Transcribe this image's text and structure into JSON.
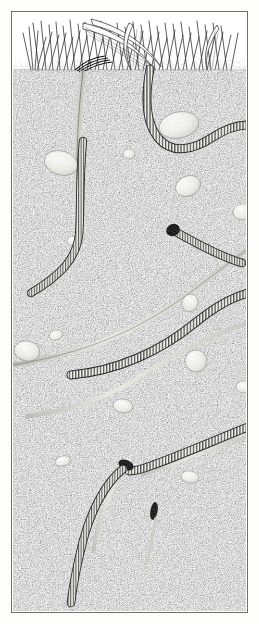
{
  "figure": {
    "medium": "pen-and-ink stipple illustration",
    "orientation": "vertical",
    "has_caption": false,
    "has_text_labels": false
  },
  "frame": {
    "border_color": "#6f6f6f",
    "margin_color": "#fdfdfb",
    "plate_background": "#ffffff"
  },
  "palette": {
    "ink": "#1a1a1a",
    "soil_dark": "#3b3b3b",
    "soil_mid": "#6b6b6b",
    "soil_light": "#d8d8d8",
    "pebble_fill": "#f4f4f0",
    "pebble_edge": "#8a8a8a",
    "worm_body": "#efefe9",
    "worm_outline": "#1c1c1c",
    "burrow_fill": "#e8e8e2",
    "grass_ink": "#2a2a2a"
  },
  "scene": {
    "layers": [
      {
        "name": "grass-layer",
        "label": "Grass blades at soil surface",
        "y_top": 0,
        "y_bottom": 60
      },
      {
        "name": "soil-layer",
        "label": "Stippled soil body",
        "y_top": 55,
        "y_bottom": 600
      }
    ]
  },
  "grass": {
    "label": "Tufted grass sward",
    "blade_count": 54,
    "surface_y": 58,
    "tuft_centers": [
      28,
      52,
      78,
      104,
      128,
      150,
      172,
      196,
      216
    ]
  },
  "soil": {
    "label": "Stippled loam soil",
    "stipple_dot_count": 5200,
    "surface_y": 56,
    "texture": "random fine stipple"
  },
  "worms": [
    {
      "name": "worm-upper-right",
      "label": "Worm descending from surface and curving right around pebble",
      "segments": 74,
      "thickness": 7.5,
      "has_dark_head": false
    },
    {
      "name": "worm-left-descending",
      "label": "Worm in vertical left burrow turning left at depth",
      "segments": 66,
      "thickness": 6.5,
      "has_dark_head": false
    },
    {
      "name": "worm-mid-head",
      "label": "Worm head emerging from mid burrow",
      "segments": 30,
      "thickness": 7,
      "has_dark_head": true
    },
    {
      "name": "worm-mid-diagonal",
      "label": "Long worm crossing mid-field diagonally",
      "segments": 86,
      "thickness": 7,
      "has_dark_head": false
    },
    {
      "name": "worm-lower-right",
      "label": "Worm descending across lower right",
      "segments": 70,
      "thickness": 7,
      "has_dark_head": true
    },
    {
      "name": "worm-bottom-left",
      "label": "Worm curving down to bottom-left corner",
      "segments": 52,
      "thickness": 7,
      "has_dark_head": true
    }
  ],
  "burrows": [
    {
      "name": "burrow-vertical-left",
      "label": "Vertical left burrow tunnel"
    },
    {
      "name": "burrow-vertical-mid",
      "label": "Vertical mid burrow from surface"
    },
    {
      "name": "burrow-lower-sweep",
      "label": "Long sweeping lower burrow channel"
    },
    {
      "name": "burrow-bottom-curve",
      "label": "Bottom curved burrow channel"
    }
  ],
  "pebbles": [
    {
      "name": "pebble-large-upper-right",
      "cx": 166,
      "cy": 112,
      "rx": 20,
      "ry": 13
    },
    {
      "name": "pebble-large-left",
      "cx": 48,
      "cy": 150,
      "rx": 17,
      "ry": 12
    },
    {
      "name": "pebble-small-mid",
      "cx": 116,
      "cy": 141,
      "rx": 6,
      "ry": 5
    },
    {
      "name": "pebble-right-upper",
      "cx": 175,
      "cy": 173,
      "rx": 13,
      "ry": 10
    },
    {
      "name": "pebble-edge-right",
      "cx": 230,
      "cy": 199,
      "rx": 10,
      "ry": 8
    },
    {
      "name": "pebble-small-left-mid",
      "cx": 60,
      "cy": 228,
      "rx": 6,
      "ry": 5
    },
    {
      "name": "pebble-mid-lower",
      "cx": 177,
      "cy": 290,
      "rx": 8,
      "ry": 9
    },
    {
      "name": "pebble-left-lower",
      "cx": 43,
      "cy": 322,
      "rx": 7,
      "ry": 5
    },
    {
      "name": "pebble-edge-left",
      "cx": 16,
      "cy": 338,
      "rx": 12,
      "ry": 10
    },
    {
      "name": "pebble-right-mid-lower",
      "cx": 183,
      "cy": 348,
      "rx": 11,
      "ry": 11
    },
    {
      "name": "pebble-right-far",
      "cx": 231,
      "cy": 374,
      "rx": 8,
      "ry": 6
    },
    {
      "name": "pebble-center-bottom",
      "cx": 110,
      "cy": 393,
      "rx": 10,
      "ry": 7
    },
    {
      "name": "pebble-left-bottom",
      "cx": 50,
      "cy": 448,
      "rx": 8,
      "ry": 5
    },
    {
      "name": "pebble-mid-bottom",
      "cx": 177,
      "cy": 464,
      "rx": 9,
      "ry": 6
    }
  ],
  "dark_marks": [
    {
      "name": "dark-head-mid",
      "label": "Dark worm head blob mid-field",
      "cx": 161,
      "cy": 218
    },
    {
      "name": "dark-tip-lower",
      "label": "Dark worm tip lower field",
      "cx": 113,
      "cy": 450
    },
    {
      "name": "dark-sliver-bottom",
      "label": "Dark sliver near bottom",
      "cx": 141,
      "cy": 498
    }
  ]
}
